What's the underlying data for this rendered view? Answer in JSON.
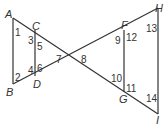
{
  "diagram": {
    "points": {
      "A": "A",
      "B": "B",
      "C": "C",
      "D": "D",
      "F": "F",
      "G": "G",
      "H": "H",
      "I": "I"
    },
    "angles": [
      "1",
      "2",
      "3",
      "4",
      "5",
      "6",
      "7",
      "8",
      "9",
      "10",
      "11",
      "12",
      "13",
      "14"
    ],
    "segments": [
      "AB",
      "CD",
      "FG",
      "HI",
      "AH",
      "BI"
    ]
  }
}
